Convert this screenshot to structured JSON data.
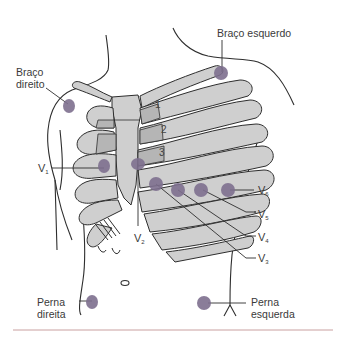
{
  "colors": {
    "electrode": "#7d6f8e",
    "bone_fill": "#cfcfcf",
    "bone_fill_dark": "#b5b5b5",
    "outline": "#2e2e2e",
    "text": "#3a3a3a",
    "footer_rule": "#c9a0a0"
  },
  "limb_labels": {
    "right_arm": [
      "Braço",
      "direito"
    ],
    "left_arm": "Braço esquerdo",
    "right_leg": [
      "Perna",
      "direita"
    ],
    "left_leg": [
      "Perna",
      "esquerda"
    ]
  },
  "rib_numbers": [
    "1",
    "2",
    "3"
  ],
  "precordial_leads": [
    {
      "id": "V1",
      "letter": "V",
      "sub": "1"
    },
    {
      "id": "V2",
      "letter": "V",
      "sub": "2"
    },
    {
      "id": "V3",
      "letter": "V",
      "sub": "3"
    },
    {
      "id": "V4",
      "letter": "V",
      "sub": "4"
    },
    {
      "id": "V5",
      "letter": "V",
      "sub": "5"
    },
    {
      "id": "V6",
      "letter": "V",
      "sub": "6"
    }
  ]
}
